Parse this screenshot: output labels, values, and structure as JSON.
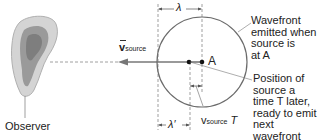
{
  "diagram": {
    "observer_label": "Observer",
    "velocity_label": "v",
    "velocity_sub": "source",
    "lambda_label": "λ",
    "lambda_prime_label": "λ′",
    "point_label": "A",
    "vT_label": "v",
    "vT_sub": "source",
    "vT_T": "T",
    "wavefront_annotation": [
      "Wavefront",
      "emitted when",
      "source is",
      "at A"
    ],
    "position_annotation": [
      "Position of",
      "source a",
      "time T later,",
      "ready to emit",
      "next wavefront"
    ],
    "colors": {
      "line": "#555555",
      "circle": "#6b6b6b",
      "ear_skin": "#c8c8c8",
      "ear_inner": "#8a8a8a"
    }
  }
}
